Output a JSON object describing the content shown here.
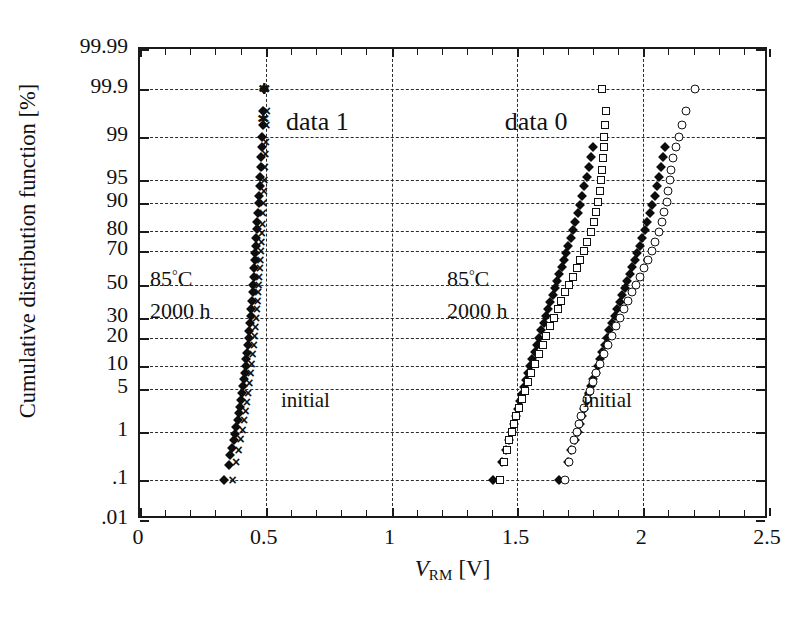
{
  "chart_data": {
    "type": "scatter",
    "title": "",
    "xlabel": "V_RM [V]",
    "xlabel_parts": {
      "symbol": "V",
      "subscript": "RM",
      "unit": "[V]"
    },
    "ylabel": "Cumulative distribution function [%]",
    "xlim": [
      0,
      2.5
    ],
    "ylim_percent": [
      0.01,
      99.99
    ],
    "y_scale": "normal-probability",
    "grid": true,
    "grid_style": "dashed",
    "legend_position": "none",
    "x_ticks": [
      0,
      0.5,
      1,
      1.5,
      2,
      2.5
    ],
    "x_tick_labels": [
      "0",
      "0.5",
      "1",
      "1.5",
      "2",
      "2.5"
    ],
    "x_minor_tick_step": 0.1,
    "y_ticks": [
      99.99,
      99.9,
      99,
      95,
      90,
      80,
      70,
      50,
      30,
      20,
      10,
      5,
      1,
      0.1,
      0.01
    ],
    "y_tick_labels": [
      "99.99",
      "99.9",
      "99",
      "95",
      "90",
      "80",
      "70",
      "50",
      "30",
      "20",
      "10",
      "5",
      "1",
      ".1",
      ".01"
    ],
    "y_gridlines": [
      99.9,
      99,
      95,
      90,
      80,
      70,
      50,
      30,
      20,
      10,
      5,
      1,
      0.1
    ],
    "x_gridlines": [
      0.5,
      1,
      1.5,
      2
    ],
    "annotations": [
      {
        "name": "data-1-label",
        "text": "data 1",
        "x": 0.58,
        "y_percent": 99.5
      },
      {
        "name": "data-0-label",
        "text": "data 0",
        "x": 1.45,
        "y_percent": 99.5
      },
      {
        "name": "data-1-condition-temp",
        "text": "85°C",
        "x": 0.04,
        "y_percent": 55
      },
      {
        "name": "data-1-condition-time",
        "text": "2000 h",
        "x": 0.04,
        "y_percent": 33
      },
      {
        "name": "data-0-condition-temp",
        "text": "85°C",
        "x": 1.22,
        "y_percent": 55
      },
      {
        "name": "data-0-condition-time",
        "text": "2000 h",
        "x": 1.22,
        "y_percent": 33
      },
      {
        "name": "data-1-initial-label",
        "text": "initial",
        "x": 0.56,
        "y_percent": 3.2
      },
      {
        "name": "data-0-initial-label",
        "text": "initial",
        "x": 1.76,
        "y_percent": 3.2
      }
    ],
    "series": [
      {
        "name": "data 1 - 85C 2000h",
        "marker": "filled-diamond",
        "group": "data 1",
        "points": [
          [
            0.333,
            0.1
          ],
          [
            0.352,
            0.22
          ],
          [
            0.358,
            0.35
          ],
          [
            0.366,
            0.5
          ],
          [
            0.372,
            0.7
          ],
          [
            0.378,
            0.9
          ],
          [
            0.383,
            1.2
          ],
          [
            0.388,
            1.6
          ],
          [
            0.392,
            2.1
          ],
          [
            0.396,
            2.7
          ],
          [
            0.4,
            3.4
          ],
          [
            0.404,
            4.3
          ],
          [
            0.408,
            5.4
          ],
          [
            0.412,
            6.7
          ],
          [
            0.416,
            8.2
          ],
          [
            0.42,
            10
          ],
          [
            0.423,
            12
          ],
          [
            0.426,
            14
          ],
          [
            0.429,
            17
          ],
          [
            0.432,
            20
          ],
          [
            0.435,
            23
          ],
          [
            0.438,
            27
          ],
          [
            0.441,
            31
          ],
          [
            0.443,
            35
          ],
          [
            0.446,
            40
          ],
          [
            0.448,
            45
          ],
          [
            0.45,
            50
          ],
          [
            0.452,
            55
          ],
          [
            0.455,
            60
          ],
          [
            0.457,
            65
          ],
          [
            0.459,
            69
          ],
          [
            0.461,
            73
          ],
          [
            0.463,
            77
          ],
          [
            0.465,
            81
          ],
          [
            0.467,
            84
          ],
          [
            0.469,
            87
          ],
          [
            0.471,
            90
          ],
          [
            0.473,
            92
          ],
          [
            0.475,
            94
          ],
          [
            0.477,
            95.5
          ],
          [
            0.479,
            96.8
          ],
          [
            0.481,
            97.8
          ],
          [
            0.483,
            98.5
          ],
          [
            0.485,
            99
          ],
          [
            0.487,
            99.4
          ],
          [
            0.49,
            99.7
          ],
          [
            0.494,
            99.9
          ]
        ]
      },
      {
        "name": "data 1 - initial",
        "marker": "cross",
        "group": "data 1",
        "points": [
          [
            0.368,
            0.1
          ],
          [
            0.382,
            0.25
          ],
          [
            0.392,
            0.45
          ],
          [
            0.4,
            0.75
          ],
          [
            0.408,
            1.1
          ],
          [
            0.414,
            1.6
          ],
          [
            0.42,
            2.3
          ],
          [
            0.425,
            3.2
          ],
          [
            0.43,
            4.4
          ],
          [
            0.435,
            6
          ],
          [
            0.44,
            8
          ],
          [
            0.444,
            10.5
          ],
          [
            0.448,
            13.5
          ],
          [
            0.452,
            17
          ],
          [
            0.455,
            21
          ],
          [
            0.458,
            25
          ],
          [
            0.461,
            30
          ],
          [
            0.464,
            35
          ],
          [
            0.467,
            40
          ],
          [
            0.469,
            45
          ],
          [
            0.471,
            50
          ],
          [
            0.473,
            55
          ],
          [
            0.476,
            60
          ],
          [
            0.478,
            65
          ],
          [
            0.48,
            70
          ],
          [
            0.482,
            75
          ],
          [
            0.484,
            79
          ],
          [
            0.486,
            83
          ],
          [
            0.488,
            87
          ],
          [
            0.49,
            90
          ],
          [
            0.492,
            93
          ],
          [
            0.494,
            95
          ],
          [
            0.496,
            96.8
          ],
          [
            0.498,
            98
          ],
          [
            0.5,
            98.8
          ],
          [
            0.502,
            99.4
          ],
          [
            0.504,
            99.7
          ],
          [
            0.498,
            99.9
          ]
        ]
      },
      {
        "name": "data 0 left branch - 85C 2000h",
        "marker": "filled-diamond",
        "group": "data 0",
        "points": [
          [
            1.405,
            0.1
          ],
          [
            1.44,
            0.25
          ],
          [
            1.455,
            0.45
          ],
          [
            1.468,
            0.7
          ],
          [
            1.478,
            1.0
          ],
          [
            1.487,
            1.4
          ],
          [
            1.495,
            1.9
          ],
          [
            1.503,
            2.5
          ],
          [
            1.511,
            3.3
          ],
          [
            1.519,
            4.2
          ],
          [
            1.527,
            5.3
          ],
          [
            1.535,
            6.6
          ],
          [
            1.543,
            8.1
          ],
          [
            1.551,
            10
          ],
          [
            1.56,
            12
          ],
          [
            1.568,
            14.5
          ],
          [
            1.577,
            17
          ],
          [
            1.586,
            20
          ],
          [
            1.595,
            23.5
          ],
          [
            1.604,
            27
          ],
          [
            1.613,
            31
          ],
          [
            1.622,
            35
          ],
          [
            1.631,
            39
          ],
          [
            1.64,
            43.5
          ],
          [
            1.649,
            48
          ],
          [
            1.658,
            52
          ],
          [
            1.667,
            56.5
          ],
          [
            1.676,
            61
          ],
          [
            1.685,
            65
          ],
          [
            1.694,
            69
          ],
          [
            1.703,
            73
          ],
          [
            1.712,
            77
          ],
          [
            1.721,
            80.5
          ],
          [
            1.73,
            84
          ],
          [
            1.739,
            87
          ],
          [
            1.748,
            89.5
          ],
          [
            1.757,
            92
          ],
          [
            1.766,
            94
          ],
          [
            1.775,
            95.5
          ],
          [
            1.784,
            96.8
          ],
          [
            1.793,
            97.8
          ],
          [
            1.8,
            98.5
          ]
        ]
      },
      {
        "name": "data 0 left branch - initial",
        "marker": "open-square",
        "group": "data 0",
        "points": [
          [
            1.43,
            0.1
          ],
          [
            1.447,
            0.25
          ],
          [
            1.458,
            0.45
          ],
          [
            1.468,
            0.7
          ],
          [
            1.477,
            1.0
          ],
          [
            1.486,
            1.4
          ],
          [
            1.496,
            1.9
          ],
          [
            1.506,
            2.6
          ],
          [
            1.517,
            3.5
          ],
          [
            1.529,
            4.6
          ],
          [
            1.542,
            6.1
          ],
          [
            1.556,
            8
          ],
          [
            1.57,
            10.5
          ],
          [
            1.585,
            13.5
          ],
          [
            1.6,
            17
          ],
          [
            1.615,
            21
          ],
          [
            1.63,
            25.5
          ],
          [
            1.645,
            30
          ],
          [
            1.66,
            35
          ],
          [
            1.675,
            40
          ],
          [
            1.69,
            45
          ],
          [
            1.705,
            50
          ],
          [
            1.72,
            55
          ],
          [
            1.735,
            60
          ],
          [
            1.75,
            65
          ],
          [
            1.764,
            70
          ],
          [
            1.778,
            75
          ],
          [
            1.791,
            79.5
          ],
          [
            1.803,
            84
          ],
          [
            1.813,
            87.5
          ],
          [
            1.821,
            90.5
          ],
          [
            1.827,
            93
          ],
          [
            1.832,
            95
          ],
          [
            1.836,
            96.5
          ],
          [
            1.84,
            97.7
          ],
          [
            1.843,
            98.5
          ],
          [
            1.846,
            99
          ],
          [
            1.849,
            99.4
          ],
          [
            1.852,
            99.7
          ],
          [
            1.838,
            99.9
          ]
        ]
      },
      {
        "name": "data 0 right branch - 85C 2000h",
        "marker": "filled-diamond",
        "group": "data 0",
        "points": [
          [
            1.665,
            0.1
          ],
          [
            1.7,
            0.25
          ],
          [
            1.715,
            0.45
          ],
          [
            1.728,
            0.7
          ],
          [
            1.739,
            1.0
          ],
          [
            1.748,
            1.4
          ],
          [
            1.757,
            1.9
          ],
          [
            1.766,
            2.5
          ],
          [
            1.775,
            3.3
          ],
          [
            1.784,
            4.3
          ],
          [
            1.793,
            5.4
          ],
          [
            1.802,
            6.7
          ],
          [
            1.811,
            8.2
          ],
          [
            1.82,
            10
          ],
          [
            1.829,
            12
          ],
          [
            1.838,
            14.5
          ],
          [
            1.847,
            17
          ],
          [
            1.857,
            20
          ],
          [
            1.866,
            23.5
          ],
          [
            1.876,
            27
          ],
          [
            1.886,
            31
          ],
          [
            1.896,
            35
          ],
          [
            1.906,
            39
          ],
          [
            1.916,
            43.5
          ],
          [
            1.926,
            48
          ],
          [
            1.936,
            52
          ],
          [
            1.946,
            56.5
          ],
          [
            1.956,
            61
          ],
          [
            1.966,
            65
          ],
          [
            1.976,
            69
          ],
          [
            1.986,
            73
          ],
          [
            1.996,
            77
          ],
          [
            2.006,
            80.5
          ],
          [
            2.016,
            84
          ],
          [
            2.026,
            87
          ],
          [
            2.036,
            89.5
          ],
          [
            2.046,
            92
          ],
          [
            2.056,
            94
          ],
          [
            2.064,
            95.5
          ],
          [
            2.072,
            96.8
          ],
          [
            2.079,
            97.8
          ],
          [
            2.085,
            98.5
          ]
        ]
      },
      {
        "name": "data 0 right branch - initial",
        "marker": "open-circle",
        "group": "data 0",
        "points": [
          [
            1.69,
            0.1
          ],
          [
            1.706,
            0.25
          ],
          [
            1.716,
            0.45
          ],
          [
            1.726,
            0.7
          ],
          [
            1.735,
            1.0
          ],
          [
            1.744,
            1.4
          ],
          [
            1.754,
            1.9
          ],
          [
            1.764,
            2.6
          ],
          [
            1.775,
            3.5
          ],
          [
            1.787,
            4.6
          ],
          [
            1.8,
            6.1
          ],
          [
            1.814,
            8
          ],
          [
            1.829,
            10.5
          ],
          [
            1.844,
            13.5
          ],
          [
            1.86,
            17
          ],
          [
            1.876,
            21
          ],
          [
            1.892,
            25.5
          ],
          [
            1.908,
            30
          ],
          [
            1.924,
            35
          ],
          [
            1.94,
            40
          ],
          [
            1.956,
            45
          ],
          [
            1.972,
            50
          ],
          [
            1.988,
            55
          ],
          [
            2.004,
            60
          ],
          [
            2.019,
            65
          ],
          [
            2.034,
            70
          ],
          [
            2.048,
            75
          ],
          [
            2.061,
            79.5
          ],
          [
            2.073,
            84
          ],
          [
            2.084,
            87.5
          ],
          [
            2.093,
            90.5
          ],
          [
            2.1,
            93
          ],
          [
            2.106,
            95
          ],
          [
            2.112,
            96.5
          ],
          [
            2.12,
            97.7
          ],
          [
            2.13,
            98.5
          ],
          [
            2.142,
            99
          ],
          [
            2.155,
            99.4
          ],
          [
            2.17,
            99.7
          ],
          [
            2.207,
            99.9
          ]
        ]
      },
      {
        "name": "data 1 - top outliers",
        "marker": "star",
        "group": "data 1",
        "points": [
          [
            0.492,
            99.9
          ],
          [
            0.489,
            99.55
          ]
        ]
      }
    ]
  }
}
